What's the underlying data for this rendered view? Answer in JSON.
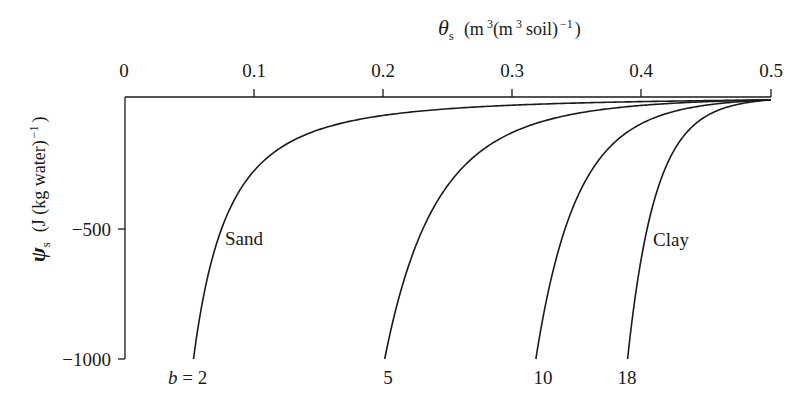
{
  "chart_data": {
    "type": "line",
    "title": "",
    "xlabel": "θs (m³ (m³ soil)⁻¹)",
    "ylabel": "ψs (J (kg water)⁻¹)",
    "x_axis_position": "top",
    "xlim": [
      0,
      0.5
    ],
    "ylim": [
      -1000,
      0
    ],
    "grid": false,
    "x_ticks": [
      0,
      0.1,
      0.2,
      0.3,
      0.4,
      0.5
    ],
    "x_tick_labels": [
      "0",
      "0.1",
      "0.2",
      "0.3",
      "0.4",
      "0.5"
    ],
    "y_ticks": [
      -500,
      -1000
    ],
    "y_tick_labels": [
      "−500",
      "−1000"
    ],
    "saturation_theta": 0.5,
    "series": [
      {
        "name": "b = 2",
        "b": 2,
        "label": "b = 2",
        "end_theta": 0.053,
        "x": [
          0.5,
          0.4,
          0.3,
          0.2,
          0.15,
          0.1,
          0.08,
          0.065,
          0.053
        ],
        "y": [
          -11,
          -17,
          -31,
          -69,
          -122,
          -275,
          -430,
          -650,
          -1000
        ]
      },
      {
        "name": "b = 5",
        "b": 5,
        "label": "5",
        "end_theta": 0.201,
        "x": [
          0.5,
          0.45,
          0.4,
          0.35,
          0.3,
          0.25,
          0.225,
          0.201
        ],
        "y": [
          -10,
          -17,
          -31,
          -60,
          -129,
          -320,
          -540,
          -1000
        ]
      },
      {
        "name": "b = 10",
        "b": 10,
        "label": "10",
        "end_theta": 0.318,
        "x": [
          0.5,
          0.47,
          0.44,
          0.41,
          0.38,
          0.35,
          0.335,
          0.318
        ],
        "y": [
          -11,
          -20,
          -40,
          -80,
          -170,
          -390,
          -600,
          -1000
        ]
      },
      {
        "name": "b = 18",
        "b": 18,
        "label": "18",
        "end_theta": 0.389,
        "x": [
          0.5,
          0.48,
          0.46,
          0.44,
          0.42,
          0.405,
          0.389
        ],
        "y": [
          -11,
          -22,
          -50,
          -110,
          -260,
          -500,
          -1000
        ]
      }
    ],
    "annotations": [
      {
        "text": "Sand",
        "near_series": "b = 2"
      },
      {
        "text": "Clay",
        "near_series": "b = 18"
      }
    ]
  },
  "labels": {
    "x_axis_symbol": "θ",
    "x_axis_sub": "s",
    "x_axis_units_1": "(m",
    "x_axis_sup_1": "3",
    "x_axis_units_2": "(m",
    "x_axis_sup_2": "3",
    "x_axis_units_3": "soil)",
    "x_axis_sup_3": "−1",
    "x_axis_units_4": ")",
    "y_axis_symbol": "ψ",
    "y_axis_sub": "s",
    "y_axis_units": "(J (kg water)",
    "y_axis_sup": "−1",
    "y_axis_close": ")",
    "x_ticks": [
      "0",
      "0.1",
      "0.2",
      "0.3",
      "0.4",
      "0.5"
    ],
    "y_ticks": [
      "−500",
      "−1000"
    ],
    "b_prefix": "b",
    "b_eq": " = 2",
    "curve_5": "5",
    "curve_10": "10",
    "curve_18": "18",
    "sand": "Sand",
    "clay": "Clay"
  }
}
